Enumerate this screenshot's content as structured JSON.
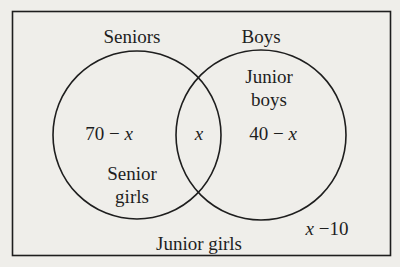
{
  "diagram": {
    "type": "venn",
    "universe_label": "Junior girls",
    "sets": [
      {
        "name": "Seniors",
        "label": "Seniors"
      },
      {
        "name": "Boys",
        "label": "Boys"
      }
    ],
    "regions": {
      "seniors_only": {
        "value": "70 − x",
        "description_line1": "Senior",
        "description_line2": "girls"
      },
      "intersection": {
        "value": "x"
      },
      "boys_only": {
        "value": "40 − x",
        "description_line1": "Junior",
        "description_line2": "boys"
      },
      "outside": {
        "value": "x −10",
        "description": "Junior girls"
      }
    },
    "colors": {
      "background": "#efeeea",
      "stroke": "#1e1e1e"
    }
  }
}
